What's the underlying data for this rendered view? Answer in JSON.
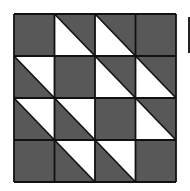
{
  "diagram": {
    "type": "quilt-block",
    "rows": 4,
    "cols": 4,
    "colors": {
      "dark": "#585858",
      "light": "#ffffff",
      "line": "#111111"
    },
    "cells": [
      [
        "solid",
        "lower-left",
        "lower-left",
        "solid"
      ],
      [
        "upper-right",
        "solid",
        "lower-left",
        "lower-left"
      ],
      [
        "upper-right",
        "upper-right",
        "solid",
        "lower-left"
      ],
      [
        "solid",
        "upper-right",
        "upper-right",
        "solid"
      ]
    ],
    "legend": {
      "solid": "fully dark square",
      "lower-left": "diagonal top-left to bottom-right, light triangle bottom-left",
      "upper-right": "diagonal top-left to bottom-right, light triangle top-right"
    }
  }
}
